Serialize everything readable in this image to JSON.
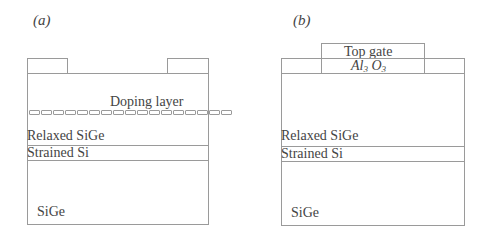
{
  "panels": [
    {
      "id": "a",
      "label": "(a)",
      "contacts": [
        "left-contact",
        "right-contact"
      ],
      "layers": {
        "doping": "Doping layer",
        "relaxed": "Relaxed SiGe",
        "strained": "Strained Si",
        "substrate": "SiGe"
      },
      "doping_segments": 17
    },
    {
      "id": "b",
      "label": "(b)",
      "gate": {
        "top_gate": "Top gate",
        "oxide_base": "Al",
        "oxide_sub1": "3",
        "oxide_o": "O",
        "oxide_sub2": "3"
      },
      "layers": {
        "relaxed": "Relaxed SiGe",
        "strained": "Strained Si",
        "substrate": "SiGe"
      }
    }
  ],
  "colors": {
    "line": "#9a9a9a",
    "text": "#444444"
  }
}
